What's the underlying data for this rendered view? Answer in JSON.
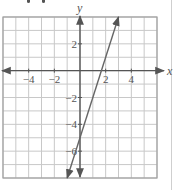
{
  "chart_data": {
    "type": "line",
    "title": "",
    "xlabel": "x",
    "ylabel": "y",
    "xlim": [
      -6,
      6
    ],
    "ylim": [
      -8,
      4
    ],
    "grid": true,
    "x_ticks": [
      {
        "v": -4,
        "label": "−4"
      },
      {
        "v": -2,
        "label": "−2"
      },
      {
        "v": 2,
        "label": "2"
      },
      {
        "v": 4,
        "label": "4"
      }
    ],
    "y_ticks": [
      {
        "v": 2,
        "label": "2"
      },
      {
        "v": -2,
        "label": "−2"
      },
      {
        "v": -4,
        "label": "−4"
      },
      {
        "v": -6,
        "label": "−6"
      }
    ],
    "series": [
      {
        "name": "y = 3x − 5",
        "equation": "y = 3x - 5",
        "x": [
          -1,
          3
        ],
        "y": [
          -8,
          4
        ],
        "arrows": "both"
      }
    ]
  },
  "colors": {
    "grid": "#c8c8c8",
    "axis": "#555555",
    "line": "#666666",
    "frame": "#a0a0a0",
    "text": "#555555"
  }
}
